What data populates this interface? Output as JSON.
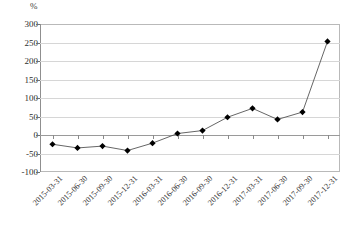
{
  "chart_data": {
    "type": "line",
    "title": "",
    "subtitle": "",
    "xlabel": "",
    "ylabel": "%",
    "unit_label": "%",
    "grid": true,
    "legend": null,
    "legend_position": "none",
    "ylim": [
      -100,
      300
    ],
    "yticks": [
      300,
      250,
      200,
      150,
      100,
      50,
      0,
      -50,
      -100
    ],
    "ytick_labels": [
      "300",
      "250",
      "200",
      "150",
      "100",
      "50",
      "0",
      "-50",
      "-100"
    ],
    "marker": "diamond",
    "marker_color": "#000000",
    "line_color": "#555555",
    "categories": [
      "2015-03-31",
      "2015-06-30",
      "2015-09-30",
      "2015-12-31",
      "2016-03-31",
      "2016-06-30",
      "2016-09-30",
      "2016-12-31",
      "2017-03-31",
      "2017-06-30",
      "2017-09-30",
      "2017-12-31"
    ],
    "values": [
      -25,
      -35,
      -30,
      -42,
      -22,
      4,
      12,
      48,
      72,
      42,
      62,
      253
    ],
    "series": [
      {
        "name": "",
        "values": [
          -25,
          -35,
          -30,
          -42,
          -22,
          4,
          12,
          48,
          72,
          42,
          62,
          253
        ]
      }
    ]
  },
  "caption": {
    "text": ""
  }
}
